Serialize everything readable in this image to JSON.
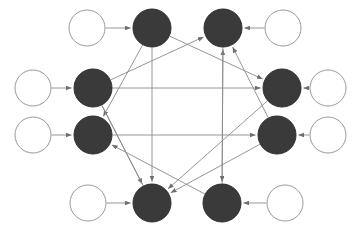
{
  "figure": {
    "type": "node-link-diagram",
    "background_color": "#ffffff",
    "width": 359,
    "height": 230
  },
  "style": {
    "filled_node_fill": "#3a3a3a",
    "filled_node_stroke": "#2e2e2e",
    "open_node_fill": "#ffffff",
    "open_node_stroke": "#9a9a9a",
    "edge_color": "#8a8a8a",
    "arrow_color": "#6e6e6e",
    "node_radius": 18,
    "edge_width": 0.9
  },
  "nodes": [
    {
      "id": "in-top-left",
      "label": "",
      "kind": "open",
      "cx": 87,
      "cy": 28,
      "r": 18
    },
    {
      "id": "in-mid-upper-left",
      "label": "",
      "kind": "open",
      "cx": 33,
      "cy": 88,
      "r": 18
    },
    {
      "id": "in-mid-lower-left",
      "label": "",
      "kind": "open",
      "cx": 33,
      "cy": 135,
      "r": 18
    },
    {
      "id": "in-bottom-left",
      "label": "",
      "kind": "open",
      "cx": 88,
      "cy": 203,
      "r": 18
    },
    {
      "id": "out-top-right",
      "label": "",
      "kind": "open",
      "cx": 283,
      "cy": 28,
      "r": 18
    },
    {
      "id": "out-mid-upper-right",
      "label": "",
      "kind": "open",
      "cx": 328,
      "cy": 88,
      "r": 18
    },
    {
      "id": "out-mid-lower-right",
      "label": "",
      "kind": "open",
      "cx": 328,
      "cy": 135,
      "r": 18
    },
    {
      "id": "out-bottom-right",
      "label": "",
      "kind": "open",
      "cx": 285,
      "cy": 203,
      "r": 18
    },
    {
      "id": "core-top-left",
      "label": "",
      "kind": "filled",
      "cx": 152,
      "cy": 28,
      "r": 19
    },
    {
      "id": "core-top-right",
      "label": "",
      "kind": "filled",
      "cx": 223,
      "cy": 28,
      "r": 19
    },
    {
      "id": "core-upper-left",
      "label": "",
      "kind": "filled",
      "cx": 93,
      "cy": 88,
      "r": 19
    },
    {
      "id": "core-upper-right",
      "label": "",
      "kind": "filled",
      "cx": 282,
      "cy": 88,
      "r": 19
    },
    {
      "id": "core-lower-left",
      "label": "",
      "kind": "filled",
      "cx": 93,
      "cy": 135,
      "r": 19
    },
    {
      "id": "core-lower-right",
      "label": "",
      "kind": "filled",
      "cx": 277,
      "cy": 135,
      "r": 19
    },
    {
      "id": "core-bottom-left",
      "label": "",
      "kind": "filled",
      "cx": 152,
      "cy": 203,
      "r": 19
    },
    {
      "id": "core-bottom-right",
      "label": "",
      "kind": "filled",
      "cx": 222,
      "cy": 203,
      "r": 19
    }
  ],
  "edges": [
    {
      "id": "e-in-tl",
      "from": "in-top-left",
      "to": "core-top-left",
      "arrow": true
    },
    {
      "id": "e-in-mul",
      "from": "in-mid-upper-left",
      "to": "core-upper-left",
      "arrow": true
    },
    {
      "id": "e-in-mll",
      "from": "in-mid-lower-left",
      "to": "core-lower-left",
      "arrow": true
    },
    {
      "id": "e-in-bl",
      "from": "in-bottom-left",
      "to": "core-bottom-left",
      "arrow": true
    },
    {
      "id": "e-out-tr",
      "from": "out-top-right",
      "to": "core-top-right",
      "arrow": true
    },
    {
      "id": "e-out-mur",
      "from": "out-mid-upper-right",
      "to": "core-upper-right",
      "arrow": true
    },
    {
      "id": "e-out-mlr",
      "from": "out-mid-lower-right",
      "to": "core-lower-right",
      "arrow": true
    },
    {
      "id": "e-out-br",
      "from": "out-bottom-right",
      "to": "core-bottom-right",
      "arrow": true
    },
    {
      "id": "e1",
      "from": "core-top-left",
      "to": "core-lower-left",
      "arrow": true
    },
    {
      "id": "e2",
      "from": "core-top-left",
      "to": "core-bottom-left",
      "arrow": true
    },
    {
      "id": "e3",
      "from": "core-upper-left",
      "to": "core-top-right",
      "arrow": true
    },
    {
      "id": "e4",
      "from": "core-upper-left",
      "to": "core-upper-right",
      "arrow": true
    },
    {
      "id": "e5",
      "from": "core-upper-left",
      "to": "core-bottom-left",
      "arrow": true
    },
    {
      "id": "e6",
      "from": "core-lower-left",
      "to": "core-lower-right",
      "arrow": true
    },
    {
      "id": "e7",
      "from": "core-bottom-right",
      "to": "core-top-right",
      "arrow": true
    },
    {
      "id": "e8",
      "from": "core-bottom-right",
      "to": "core-lower-left",
      "arrow": true
    },
    {
      "id": "e9",
      "from": "core-lower-right",
      "to": "core-top-right",
      "arrow": true
    },
    {
      "id": "e10",
      "from": "core-lower-right",
      "to": "core-bottom-left",
      "arrow": true
    },
    {
      "id": "e11",
      "from": "core-top-right",
      "to": "core-bottom-right",
      "arrow": true
    },
    {
      "id": "e12",
      "from": "core-top-left",
      "to": "core-upper-right",
      "arrow": true
    },
    {
      "id": "e13",
      "from": "core-upper-right",
      "to": "core-bottom-left",
      "arrow": true
    },
    {
      "id": "e14",
      "from": "core-bottom-left",
      "to": "core-upper-left",
      "arrow": false
    }
  ]
}
